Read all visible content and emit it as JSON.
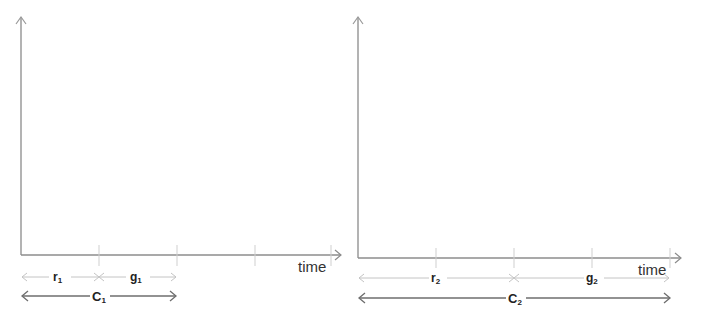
{
  "diagrams": [
    {
      "id": "cycle-1",
      "x_axis_label": "time",
      "red_label": "r",
      "red_sub": "1",
      "green_label": "g",
      "green_sub": "1",
      "cycle_label": "C",
      "cycle_sub": "1"
    },
    {
      "id": "cycle-2",
      "x_axis_label": "time",
      "red_label": "r",
      "red_sub": "2",
      "green_label": "g",
      "green_sub": "2",
      "cycle_label": "C",
      "cycle_sub": "2"
    }
  ],
  "colors": {
    "axis": "#8c8c8c",
    "tick": "#c8c8c8",
    "phase_arrow": "#c4c4c4",
    "cycle_arrow": "#6e6e6e",
    "text": "#222222"
  }
}
